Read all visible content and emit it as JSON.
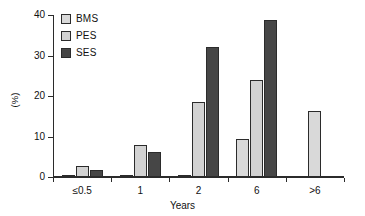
{
  "chart_data": {
    "type": "bar",
    "title": "",
    "xlabel": "Years",
    "ylabel": "(%)",
    "categories": [
      "≤0.5",
      "1",
      "2",
      "6",
      ">6"
    ],
    "series": [
      {
        "name": "BMS",
        "color": "#d9d9d9",
        "values": [
          0.5,
          0.5,
          0.5,
          9.3,
          16.2
        ]
      },
      {
        "name": "PES",
        "color": "#d2d2d2",
        "values": [
          2.8,
          8.0,
          18.5,
          24.0,
          null
        ]
      },
      {
        "name": "SES",
        "color": "#464646",
        "values": [
          1.7,
          6.2,
          32.0,
          38.8,
          null
        ]
      }
    ],
    "ylim": [
      0,
      40
    ],
    "yticks": [
      0,
      10,
      20,
      30,
      40
    ],
    "ytick_labels": [
      "0",
      "10",
      "20",
      "30",
      "40"
    ],
    "grid": false,
    "legend_position": "top-left"
  },
  "legend": {
    "items": [
      {
        "label": "BMS",
        "color": "#d9d9d9"
      },
      {
        "label": "PES",
        "color": "#d2d2d2"
      },
      {
        "label": "SES",
        "color": "#464646"
      }
    ]
  },
  "axes": {
    "x_title": "Years",
    "y_title": "(%)"
  }
}
